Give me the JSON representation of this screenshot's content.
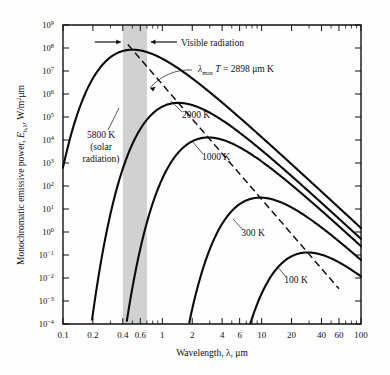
{
  "chart_data": {
    "type": "line",
    "title": "",
    "xlabel": "Wavelength, λ, μm",
    "ylabel": "Monochromatic emissive power, E_{b,λ}, W/m²·μm",
    "xscale": "log",
    "yscale": "log",
    "xlim": [
      0.1,
      100
    ],
    "ylim": [
      0.0001,
      1000000000.0
    ],
    "grid": false,
    "legend": "inline-labels",
    "xtick_labels": [
      "0.1",
      "0.2",
      "0.4",
      "0.6",
      "1",
      "2",
      "4",
      "6",
      "10",
      "20",
      "40",
      "60",
      "100"
    ],
    "xtick_values": [
      0.1,
      0.2,
      0.4,
      0.6,
      1,
      2,
      4,
      6,
      10,
      20,
      40,
      60,
      100
    ],
    "ytick_labels": [
      "10 9",
      "10 8",
      "10 7",
      "10 6",
      "10 5",
      "10 4",
      "10 3",
      "10 2",
      "10 1",
      "10 0",
      "10⁻ 1",
      "10⁻ 2",
      "10⁻ 3",
      "10⁻ 4"
    ],
    "ytick_mantissas": [
      "10",
      "10",
      "10",
      "10",
      "10",
      "10",
      "10",
      "10",
      "10",
      "10",
      "10",
      "10",
      "10",
      "10"
    ],
    "ytick_exponents": [
      "9",
      "8",
      "7",
      "6",
      "5",
      "4",
      "3",
      "2",
      "1",
      "0",
      "−1",
      "−2",
      "−3",
      "−4"
    ],
    "ytick_values": [
      1000000000.0,
      100000000.0,
      10000000.0,
      1000000.0,
      100000.0,
      10000.0,
      1000.0,
      100,
      10,
      1,
      0.1,
      0.01,
      0.001,
      0.0001
    ],
    "series": [
      {
        "name": "5800 K (solar radiation)",
        "temperature_K": 5800,
        "label": "5800 K\n(solar\nradiation)",
        "peak_lambda_um": 0.4997,
        "peak_value": 83000000.0
      },
      {
        "name": "2000 K",
        "temperature_K": 2000,
        "label": "2000 K",
        "peak_lambda_um": 1.449,
        "peak_value": 410000.0
      },
      {
        "name": "1000 K",
        "temperature_K": 1000,
        "label": "1000 K",
        "peak_lambda_um": 2.898,
        "peak_value": 12900.0
      },
      {
        "name": "300 K",
        "temperature_K": 300,
        "label": "300 K",
        "peak_lambda_um": 9.66,
        "peak_value": 31.4
      },
      {
        "name": "100 K",
        "temperature_K": 100,
        "label": "100 K",
        "peak_lambda_um": 28.98,
        "peak_value": 0.129
      }
    ],
    "annotations": [
      {
        "id": "visible-band",
        "text": "Visible radiation",
        "lambda_range_um": [
          0.4,
          0.7
        ],
        "style": "shaded band with inward arrows"
      },
      {
        "id": "wien-law",
        "text": "λmax T = 2898 μm K",
        "lambda_symbol": "λ",
        "sub": "max",
        "t_symbol": "T",
        "equals": "= 2898",
        "units": "μm K",
        "style": "dashed locus through curve peaks"
      }
    ],
    "curve_labels": {
      "solar_line1": "5800 K",
      "solar_line2": "(solar",
      "solar_line3": "radiation)",
      "t2000": "2000 K",
      "t1000": "1000 K",
      "t300": "300 K",
      "t100": "100 K"
    }
  },
  "figure": {
    "axis_color": "#111111",
    "curve_color": "#0b0b0b",
    "band_color": "#c9c9c9",
    "background": "#fefefe"
  }
}
